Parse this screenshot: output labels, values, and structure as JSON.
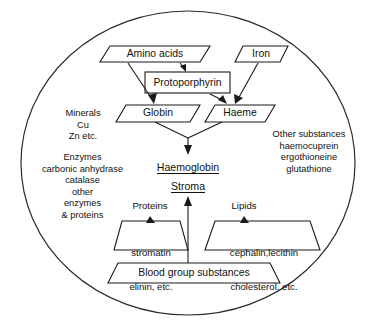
{
  "diagram": {
    "boundary": {
      "shape": "ellipse",
      "name": "cell-membrane-boundary"
    },
    "nodes": {
      "amino_acids": {
        "label": "Amino acids",
        "shape": "parallelogram"
      },
      "iron": {
        "label": "Iron",
        "shape": "parallelogram"
      },
      "protoporphyrin": {
        "label": "Protoporphyrin",
        "shape": "rectangle"
      },
      "globin": {
        "label": "Globin",
        "shape": "parallelogram"
      },
      "haeme": {
        "label": "Haeme",
        "shape": "parallelogram"
      },
      "haemoglobin": {
        "label": "Haemoglobin",
        "style": "underlined"
      },
      "stroma": {
        "label": "Stroma",
        "style": "underlined"
      },
      "proteins_heading": {
        "label": "Proteins"
      },
      "lipids_heading": {
        "label": "Lipids"
      },
      "proteins_box": {
        "line1": "stromatin",
        "line2": "elinin, etc.",
        "shape": "trapezoid"
      },
      "lipids_box": {
        "line1": "cephalin,lecithin",
        "line2": "cholesterol, etc.",
        "shape": "trapezoid"
      },
      "blood_group": {
        "label": "Blood group substances",
        "shape": "trapezoid"
      }
    },
    "left_annotations": {
      "minerals_block": "Minerals\nCu\nZn etc.",
      "enzymes_block": "Enzymes\ncarbonic anhydrase\ncatalase\nother\nenzymes\n& proteins"
    },
    "right_annotations": {
      "other_substances_block": "Other substances\nhaemocuprein\nergothioneine\nglutathione"
    },
    "colors": {
      "stroke": "#1a1a1a",
      "background": "#ffffff",
      "text": "#111111"
    }
  }
}
